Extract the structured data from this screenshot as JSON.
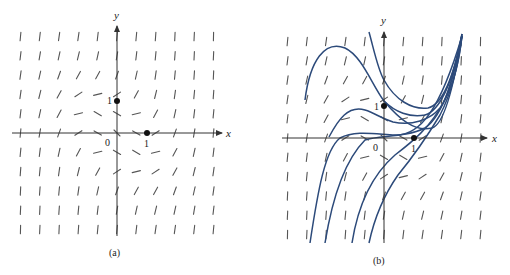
{
  "chart_data": [
    {
      "type": "slope_field",
      "panel_label": "(a)",
      "xlabel": "x",
      "ylabel": "y",
      "origin_label": "0",
      "tick_labels": {
        "x": "1",
        "y": "1"
      },
      "marked_points": [
        {
          "x": 0,
          "y": 1
        },
        {
          "x": 1,
          "y": 0
        }
      ],
      "grid": false,
      "curves": []
    },
    {
      "type": "slope_field",
      "panel_label": "(b)",
      "xlabel": "x",
      "ylabel": "y",
      "origin_label": "0",
      "tick_labels": {
        "x": "1",
        "y": "1"
      },
      "marked_points": [
        {
          "x": 0,
          "y": 1
        },
        {
          "x": 1,
          "y": 0
        }
      ],
      "grid": false,
      "curve_color": "#2c4a7a",
      "solution_curves_count": 8
    }
  ],
  "colors": {
    "ink": "#333333",
    "curve": "#2c4a7a",
    "segment": "#555555"
  }
}
